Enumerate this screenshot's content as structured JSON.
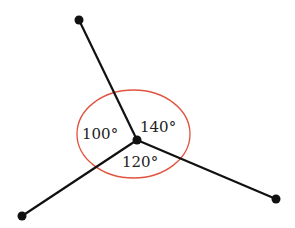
{
  "diagram": {
    "center": {
      "x": 137,
      "y": 140
    },
    "endpoints": [
      {
        "name": "top",
        "x": 79,
        "y": 20
      },
      {
        "name": "bottom-left",
        "x": 22,
        "y": 216
      },
      {
        "name": "bottom-right",
        "x": 276,
        "y": 199
      }
    ],
    "circle": {
      "cx": 133.5,
      "cy": 134,
      "rx": 56.5,
      "ry": 44,
      "color": "#e0533f"
    },
    "line_color": "#111111",
    "angles": [
      {
        "label": "100°",
        "x": 82,
        "y": 139
      },
      {
        "label": "140°",
        "x": 140,
        "y": 132
      },
      {
        "label": "120°",
        "x": 122,
        "y": 167
      }
    ]
  }
}
